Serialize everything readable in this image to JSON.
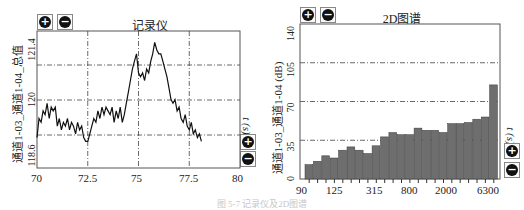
{
  "left_panel": {
    "title": "记录仪",
    "ylabel": "通道1-03_通道1-04_总值",
    "right_axis_label": "t (s)",
    "zoom_in_icon": "plus-circle-icon",
    "zoom_out_icon": "minus-circle-icon",
    "yticks": [
      "121.4",
      "120",
      "118.6"
    ],
    "xticks": [
      "70",
      "72.5",
      "75",
      "77.5",
      "80"
    ]
  },
  "right_panel": {
    "title": "2D图谱",
    "ylabel": "通道1-03_通道1-04 (dB)",
    "right_axis_label": "t (s)",
    "zoom_in_icon": "plus-circle-icon",
    "zoom_out_icon": "minus-circle-icon",
    "yticks": [
      "140",
      "105",
      "70",
      "35",
      "0"
    ],
    "xticks": [
      "90",
      "125",
      "315",
      "800",
      "2000",
      "6300"
    ]
  },
  "caption": "图 5-7  记录仪及2D图谱",
  "chart_data": [
    {
      "type": "line",
      "title": "记录仪",
      "xlabel": "",
      "ylabel": "通道1-03_通道1-04_总值",
      "xlim": [
        70,
        80
      ],
      "ylim": [
        118.2,
        121.8
      ],
      "xticks": [
        70,
        72.5,
        75,
        77.5,
        80
      ],
      "yticks_labeled": [
        121.4,
        120,
        118.6
      ],
      "grid": true,
      "grid_style": "dash-dot",
      "x": [
        70.0,
        70.1,
        70.2,
        70.3,
        70.4,
        70.5,
        70.6,
        70.7,
        70.8,
        70.9,
        71.0,
        71.1,
        71.2,
        71.3,
        71.4,
        71.5,
        71.6,
        71.7,
        71.8,
        71.9,
        72.0,
        72.1,
        72.2,
        72.3,
        72.4,
        72.5,
        72.6,
        72.7,
        72.8,
        72.9,
        73.0,
        73.1,
        73.2,
        73.3,
        73.4,
        73.5,
        73.6,
        73.7,
        73.8,
        73.9,
        74.0,
        74.1,
        74.2,
        74.3,
        74.4,
        74.5,
        74.6,
        74.7,
        74.8,
        74.9,
        75.0,
        75.1,
        75.2,
        75.3,
        75.4,
        75.5,
        75.6,
        75.7,
        75.8,
        75.9,
        76.0,
        76.1,
        76.2,
        76.3,
        76.4,
        76.5,
        76.6,
        76.7,
        76.8,
        76.9,
        77.0,
        77.1,
        77.2,
        77.3,
        77.4,
        77.5,
        77.6,
        77.7,
        77.8,
        77.9,
        78.0,
        78.1,
        78.2,
        78.3
      ],
      "values": [
        119.0,
        119.5,
        119.4,
        119.7,
        119.6,
        119.9,
        119.5,
        119.8,
        119.7,
        119.8,
        119.3,
        119.5,
        119.2,
        119.4,
        119.3,
        119.5,
        119.2,
        119.4,
        119.3,
        119.1,
        119.4,
        119.2,
        119.3,
        119.0,
        118.9,
        118.9,
        119.1,
        119.3,
        119.5,
        119.4,
        119.7,
        119.5,
        119.8,
        119.6,
        119.8,
        119.7,
        119.6,
        119.8,
        119.4,
        119.7,
        119.5,
        119.8,
        119.4,
        119.6,
        119.9,
        120.2,
        120.5,
        120.8,
        121.0,
        121.2,
        120.7,
        120.6,
        120.7,
        120.5,
        120.8,
        120.7,
        121.0,
        121.2,
        121.5,
        121.3,
        121.2,
        121.2,
        121.0,
        120.8,
        120.6,
        120.3,
        120.0,
        119.9,
        120.0,
        119.7,
        119.8,
        119.5,
        119.4,
        119.6,
        119.3,
        119.2,
        119.4,
        119.1,
        119.2,
        119.0,
        119.1,
        118.9
      ]
    },
    {
      "type": "bar",
      "title": "2D图谱",
      "xlabel": "",
      "ylabel": "通道1-03_通道1-04 (dB)",
      "ylim": [
        0,
        140
      ],
      "yticks": [
        0,
        35,
        70,
        105,
        140
      ],
      "xticks_labeled": [
        "90",
        "125",
        "315",
        "800",
        "2000",
        "6300"
      ],
      "grid": true,
      "grid_style": "dash-dot",
      "bar_color": "#6e6e6e",
      "values": [
        13,
        16,
        21,
        19,
        26,
        29,
        26,
        23,
        30,
        38,
        42,
        40,
        40,
        46,
        44,
        44,
        42,
        50,
        50,
        51,
        54,
        56,
        85
      ]
    }
  ]
}
